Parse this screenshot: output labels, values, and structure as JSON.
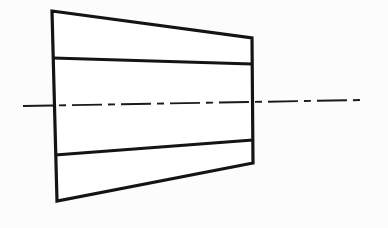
{
  "figure": {
    "kind": "engineering-line-drawing",
    "background_color": "#fcfcfc",
    "line_color": "#141414",
    "fill_color": "#ffffff",
    "axis_color": "#1a1a1a",
    "canvas": {
      "width": 388,
      "height": 228
    }
  },
  "geometry": {
    "outline": {
      "name": "tapered-body-outline",
      "points": "52,11 252,38 253,163 57,201",
      "closed": true,
      "stroke_width": 3.2,
      "corners": [
        {
          "label": "top-left",
          "x": 52,
          "y": 11
        },
        {
          "label": "top-right",
          "x": 252,
          "y": 38
        },
        {
          "label": "bottom-right",
          "x": 253,
          "y": 163
        },
        {
          "label": "bottom-left",
          "x": 57,
          "y": 201
        }
      ]
    },
    "division_lines": [
      {
        "name": "upper-division-line",
        "x1": 53,
        "y1": 58,
        "x2": 252,
        "y2": 64,
        "stroke_width": 3.0
      },
      {
        "name": "lower-division-line",
        "x1": 55,
        "y1": 155,
        "x2": 253,
        "y2": 140,
        "stroke_width": 3.0
      }
    ],
    "center_axis": {
      "name": "center-axis-line",
      "style": "dash-dot",
      "x1": 23,
      "y1": 106,
      "x2": 363,
      "y2": 100,
      "stroke_width": 1.9,
      "dash_pattern": "30 6 7 6"
    }
  }
}
